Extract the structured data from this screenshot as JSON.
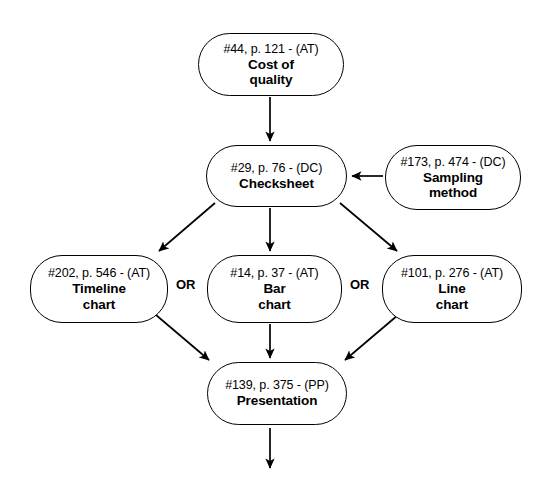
{
  "diagram": {
    "type": "flowchart",
    "title_visible": false,
    "nodes": [
      {
        "id": "cost-of-quality",
        "ref": "#44, p. 121 - (AT)",
        "title": "Cost of\nquality",
        "x": 198,
        "y": 33,
        "w": 146,
        "h": 63
      },
      {
        "id": "checksheet",
        "ref": "#29, p. 76 - (DC)",
        "title": "Checksheet",
        "x": 206,
        "y": 145,
        "w": 141,
        "h": 62
      },
      {
        "id": "sampling-method",
        "ref": "#173, p. 474 - (DC)",
        "title": "Sampling\nmethod",
        "x": 385,
        "y": 145,
        "w": 136,
        "h": 65
      },
      {
        "id": "timeline-chart",
        "ref": "#202, p. 546 - (AT)",
        "title": "Timeline\nchart",
        "x": 30,
        "y": 255,
        "w": 138,
        "h": 68
      },
      {
        "id": "bar-chart",
        "ref": "#14, p. 37 - (AT)",
        "title": "Bar\nchart",
        "x": 207,
        "y": 255,
        "w": 135,
        "h": 68
      },
      {
        "id": "line-chart",
        "ref": "#101, p. 276 - (AT)",
        "title": "Line\nchart",
        "x": 382,
        "y": 255,
        "w": 140,
        "h": 68
      },
      {
        "id": "presentation",
        "ref": "#139, p. 375 - (PP)",
        "title": "Presentation",
        "x": 207,
        "y": 362,
        "w": 140,
        "h": 63
      }
    ],
    "or_labels": [
      {
        "id": "or-left",
        "text": "OR",
        "x": 176,
        "y": 277
      },
      {
        "id": "or-right",
        "text": "OR",
        "x": 350,
        "y": 277
      }
    ],
    "edges": [
      {
        "id": "cost-to-checksheet",
        "from": "cost-of-quality",
        "to": "checksheet",
        "kind": "vertical-down"
      },
      {
        "id": "sampling-to-checksheet",
        "from": "sampling-method",
        "to": "checksheet",
        "kind": "horizontal-left"
      },
      {
        "id": "checksheet-to-timeline",
        "from": "checksheet",
        "to": "timeline-chart",
        "kind": "diagonal-down-left"
      },
      {
        "id": "checksheet-to-bar",
        "from": "checksheet",
        "to": "bar-chart",
        "kind": "vertical-down"
      },
      {
        "id": "checksheet-to-line",
        "from": "checksheet",
        "to": "line-chart",
        "kind": "diagonal-down-right"
      },
      {
        "id": "timeline-to-presentation",
        "from": "timeline-chart",
        "to": "presentation",
        "kind": "diagonal-down-right"
      },
      {
        "id": "bar-to-presentation",
        "from": "bar-chart",
        "to": "presentation",
        "kind": "vertical-down"
      },
      {
        "id": "line-to-presentation",
        "from": "line-chart",
        "to": "presentation",
        "kind": "diagonal-down-left"
      },
      {
        "id": "presentation-to-next",
        "from": "presentation",
        "to": null,
        "kind": "vertical-down-open"
      }
    ],
    "colors": {
      "stroke": "#000000",
      "fill": "#ffffff",
      "text": "#000000"
    }
  }
}
